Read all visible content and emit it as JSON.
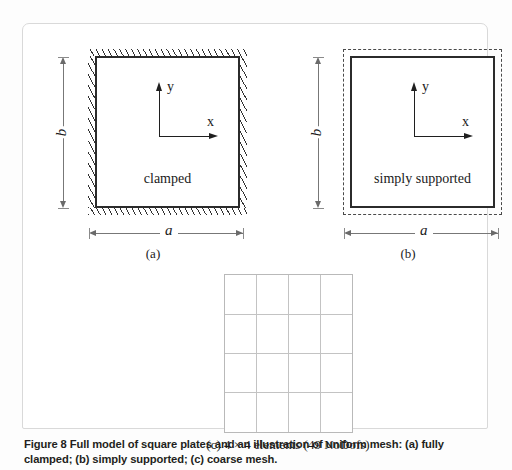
{
  "figure": {
    "caption": "Figure 8 Full model of square plates and an illustration of uniform mesh: (a) fully clamped; (b) simply supported; (c) coarse mesh.",
    "number": "Figure 8"
  },
  "panels": [
    {
      "id": "a",
      "sub_label": "(a)",
      "boundary_condition": "clamped",
      "width_label": "a",
      "height_label": "b",
      "axis_x_label": "x",
      "axis_y_label": "y",
      "edge_style": "hatched"
    },
    {
      "id": "b",
      "sub_label": "(b)",
      "boundary_condition": "simply supported",
      "width_label": "a",
      "height_label": "b",
      "axis_x_label": "x",
      "axis_y_label": "y",
      "edge_style": "dashed"
    },
    {
      "id": "c",
      "sub_label": "(c) 4 × 4 elements (49 NoDofs)",
      "mesh": {
        "columns": 4,
        "rows": 4,
        "elements": "4 × 4",
        "nodofs": "49 NoDofs"
      }
    }
  ],
  "colors": {
    "plate_outline": "#2b2b2b",
    "mesh_line": "#c3c3c3",
    "dimension_line": "#777777",
    "caption_text": "#231f20",
    "card_background": "#ffffff",
    "page_background": "#fdfdfd"
  }
}
